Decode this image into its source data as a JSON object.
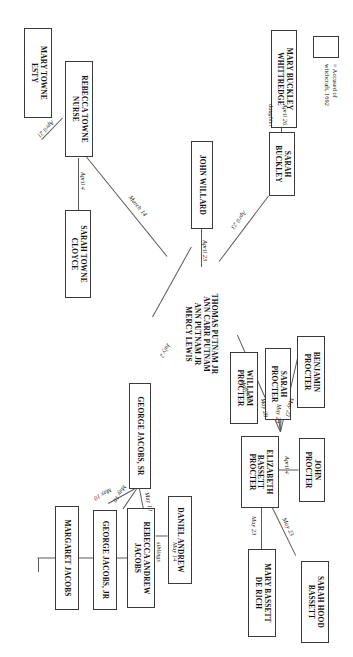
{
  "diagram": {
    "orientation": "landscape-rotated-90cw",
    "legend": {
      "symbol_name": "accused-box",
      "text": "= Accused of\nwitchcraft, 1692"
    },
    "nodes": [
      {
        "id": "mary-buckley-whittredge",
        "label": "MARY BUCKLEY\nWHITTREDGE",
        "x": 30,
        "y": 56,
        "w": 98,
        "h": 26
      },
      {
        "id": "sarah-buckley",
        "label": "SARAH\nBUCKLEY",
        "x": 132,
        "y": 58,
        "w": 70,
        "h": 26
      },
      {
        "id": "john-willard",
        "label": "JOHN WILLARD",
        "x": 141,
        "y": 140,
        "w": 88,
        "h": 22
      },
      {
        "id": "thomas-putnam-group",
        "label": "THOMAS PUTNAM JR\nANN CARR PUTNAM\nANN PUTNAM JR\nMERCY LEWIS",
        "x": 265,
        "y": 134,
        "w": 112,
        "h": 44,
        "noborder": true
      },
      {
        "id": "rebecca-towne-nurse",
        "label": "REBECCA TOWNE\nNURSE",
        "x": 62,
        "y": 263,
        "w": 96,
        "h": 27
      },
      {
        "id": "mary-towne-esty",
        "label": "MARY TOWNE\nESTY",
        "x": 122,
        "y": 301,
        "w": 86,
        "h": 27
      },
      {
        "id": "sarah-towne-cloyce",
        "label": "SARAH TOWNE\nCLOYCE",
        "x": 210,
        "y": 262,
        "w": 88,
        "h": 24
      },
      {
        "id": "benjamin-procter",
        "label": "BENJAMIN\nPROCTER",
        "x": 278,
        "y": 30,
        "w": 72,
        "h": 28
      },
      {
        "id": "sarah-procter",
        "label": "SARAH\nPROCTER",
        "x": 312,
        "y": 30,
        "w": 72,
        "h": 26
      },
      {
        "id": "william-procter",
        "label": "WILLIAM\nPROCTER",
        "x": 345,
        "y": 30,
        "w": 72,
        "h": 28
      },
      {
        "id": "john-procter",
        "label": "JOHN\nPROCTER",
        "x": 438,
        "y": 28,
        "w": 66,
        "h": 26
      },
      {
        "id": "elizabeth-bassett-procter",
        "label": "ELIZABETH\nBASSETT\nPROCTER",
        "x": 436,
        "y": 74,
        "w": 72,
        "h": 38
      },
      {
        "id": "sarah-hood-bassett",
        "label": "SARAH HOOD\nBASSETT",
        "x": 548,
        "y": 26,
        "w": 82,
        "h": 26
      },
      {
        "id": "mary-bassett-de-rich",
        "label": "MARY BASSETT\nDE RICH",
        "x": 548,
        "y": 76,
        "w": 88,
        "h": 26
      },
      {
        "id": "george-jacobs-sr",
        "label": "GEORGE JACOBS, SR",
        "x": 383,
        "y": 200,
        "w": 106,
        "h": 22
      },
      {
        "id": "daniel-andrew",
        "label": "DANIEL ANDREW",
        "x": 502,
        "y": 161,
        "w": 88,
        "h": 24
      },
      {
        "id": "rebecca-andrew-jacobs",
        "label": "REBECCA ANDREW\nJACOBS",
        "x": 502,
        "y": 196,
        "w": 100,
        "h": 26
      },
      {
        "id": "george-jacobs-jr",
        "label": "GEORGE JACOBS, JR",
        "x": 510,
        "y": 233,
        "w": 100,
        "h": 24
      },
      {
        "id": "margaret-jacobs",
        "label": "MARGARET JACOBS",
        "x": 506,
        "y": 272,
        "w": 104,
        "h": 24
      }
    ],
    "edge_labels": [
      {
        "id": "april-26",
        "text": "April 26"
      },
      {
        "id": "daughter",
        "text": "daughter"
      },
      {
        "id": "april-23-buckley",
        "text": "April 23"
      },
      {
        "id": "april-23-willard",
        "text": "April 23"
      },
      {
        "id": "march-14",
        "text": "March 14"
      },
      {
        "id": "april-21",
        "text": "April 21"
      },
      {
        "id": "april-4-towne",
        "text": "April 4"
      },
      {
        "id": "july-2",
        "text": "July 2"
      },
      {
        "id": "may-23-benjamin",
        "text": "May 23"
      },
      {
        "id": "may-29-sarah",
        "text": "May 29"
      },
      {
        "id": "may-28-william",
        "text": "May 28"
      },
      {
        "id": "march-6",
        "text": "March 6"
      },
      {
        "id": "april-4-procter",
        "text": "April 4"
      },
      {
        "id": "may-23-hood",
        "text": "May 23"
      },
      {
        "id": "may-23-derich",
        "text": "May 23"
      },
      {
        "id": "may-14-siblings",
        "text": "May 14"
      },
      {
        "id": "siblings",
        "text": "siblings"
      },
      {
        "id": "may-10-rebecca",
        "text": "May 10"
      },
      {
        "id": "may-10-george-jr",
        "text": "May 10"
      },
      {
        "id": "may-10-margaret",
        "text": "May 10"
      }
    ]
  }
}
